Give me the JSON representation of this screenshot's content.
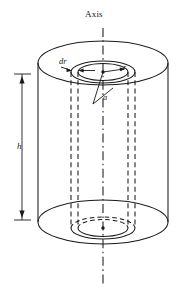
{
  "figure": {
    "type": "technical-diagram",
    "background_color": "#ffffff",
    "line_color": "#1a1a1a",
    "labels": {
      "axis": "Axis",
      "thickness": "dr",
      "radius": "r",
      "outer_radius": "a",
      "height": "h"
    },
    "geometry": {
      "canvas_width": 193,
      "canvas_height": 291,
      "axis_x": 103,
      "axis_top_y": 28,
      "axis_bottom_y": 287,
      "outer_cylinder": {
        "center_x": 103,
        "top_ellipse_cy": 63,
        "bottom_ellipse_cy": 222,
        "rx": 65,
        "ry": 22,
        "left_wall_x": 38,
        "right_wall_x": 168
      },
      "inner_shell": {
        "center_x": 103,
        "top_ellipse_cy": 72,
        "bottom_ellipse_cy": 228,
        "outer_rx": 32,
        "outer_ry": 11,
        "inner_rx": 25,
        "inner_ry": 8.5
      },
      "height_dimension": {
        "x": 22,
        "top_y": 74,
        "bottom_y": 220
      }
    }
  }
}
